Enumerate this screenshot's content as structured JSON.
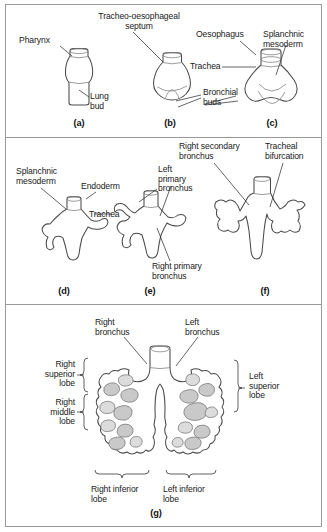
{
  "figure": {
    "background": "#ffffff",
    "frame_color": "#9a9a9a",
    "ink_color": "#4a4a4a",
    "shade_color": "#c9c9c9"
  },
  "panels": [
    {
      "id": "a",
      "letter": "(a)",
      "labels": [
        {
          "name": "pharynx",
          "text": "Pharynx"
        },
        {
          "name": "lung-bud",
          "text": "Lung\nbud"
        }
      ]
    },
    {
      "id": "b",
      "letter": "(b)",
      "labels": [
        {
          "name": "tracheo-oesophageal-septum",
          "text": "Tracheo-oesophageal\nseptum"
        },
        {
          "name": "bronchial-buds",
          "text": "Bronchial\nbuds"
        }
      ]
    },
    {
      "id": "c",
      "letter": "(c)",
      "labels": [
        {
          "name": "oesophagus",
          "text": "Oesophagus"
        },
        {
          "name": "splanchnic-mesoderm",
          "text": "Splanchnic\nmesoderm"
        },
        {
          "name": "trachea",
          "text": "Trachea"
        }
      ]
    },
    {
      "id": "d",
      "letter": "(d)",
      "labels": [
        {
          "name": "splanchnic-mesoderm",
          "text": "Splanchnic\nmesoderm"
        },
        {
          "name": "endoderm",
          "text": "Endoderm"
        },
        {
          "name": "trachea",
          "text": "Trachea"
        }
      ]
    },
    {
      "id": "e",
      "letter": "(e)",
      "labels": [
        {
          "name": "left-primary-bronchus",
          "text": "Left\nprimary\nbronchus"
        },
        {
          "name": "right-primary-bronchus",
          "text": "Right primary\nbronchus"
        }
      ]
    },
    {
      "id": "f",
      "letter": "(f)",
      "labels": [
        {
          "name": "right-secondary-bronchus",
          "text": "Right secondary\nbronchus"
        },
        {
          "name": "tracheal-bifurcation",
          "text": "Tracheal\nbifurcation"
        }
      ]
    },
    {
      "id": "g",
      "letter": "(g)",
      "labels": [
        {
          "name": "right-bronchus",
          "text": "Right\nbronchus"
        },
        {
          "name": "left-bronchus",
          "text": "Left\nbronchus"
        },
        {
          "name": "right-superior-lobe",
          "text": "Right\nsuperior\nlobe"
        },
        {
          "name": "right-middle-lobe",
          "text": "Right\nmiddle\nlobe"
        },
        {
          "name": "left-superior-lobe",
          "text": "Left\nsuperior\nlobe"
        },
        {
          "name": "right-inferior-lobe",
          "text": "Right inferior\nlobe"
        },
        {
          "name": "left-inferior-lobe",
          "text": "Left inferior\nlobe"
        }
      ]
    }
  ]
}
